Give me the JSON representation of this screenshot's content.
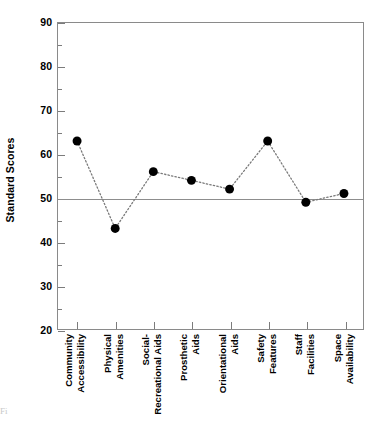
{
  "chart_data": {
    "type": "line",
    "title": "",
    "xlabel": "",
    "ylabel": "Standard Scores",
    "ylim": [
      20,
      90
    ],
    "ytick_labels": [
      "90",
      "80",
      "70",
      "60",
      "50",
      "40",
      "30",
      "20"
    ],
    "ytick_values": [
      90,
      80,
      70,
      60,
      50,
      40,
      30,
      20
    ],
    "minor_tick_values": [
      85,
      75,
      65,
      55,
      45,
      35,
      25
    ],
    "grid": false,
    "legend": "none",
    "reference_line": {
      "value": 50,
      "label": "",
      "color": "#8d8d8d"
    },
    "marker": {
      "shape": "circle",
      "color": "#000000",
      "size": 9
    },
    "line_style": "dotted",
    "line_color": "#7a7a7a",
    "categories": [
      "Community Accessibility",
      "Physical Amenities",
      "Social-Recreational Aids",
      "Prosthetic Aids",
      "Orientational Aids",
      "Safety Features",
      "Staff Facilities",
      "Space Availability"
    ],
    "category_lines": [
      {
        "l1": "Community",
        "l2": "Accessibility"
      },
      {
        "l1": "Physical",
        "l2": "Amenities"
      },
      {
        "l1": "Social-",
        "l2": "Recreational Aids"
      },
      {
        "l1": "Prosthetic",
        "l2": "Aids"
      },
      {
        "l1": "Orientational",
        "l2": "Aids"
      },
      {
        "l1": "Safety",
        "l2": "Features"
      },
      {
        "l1": "Staff",
        "l2": "Facilities"
      },
      {
        "l1": "Space",
        "l2": "Availability"
      }
    ],
    "values": [
      63,
      43,
      56,
      54,
      52,
      63,
      49,
      51
    ]
  },
  "caption": {
    "text": "Fi"
  }
}
